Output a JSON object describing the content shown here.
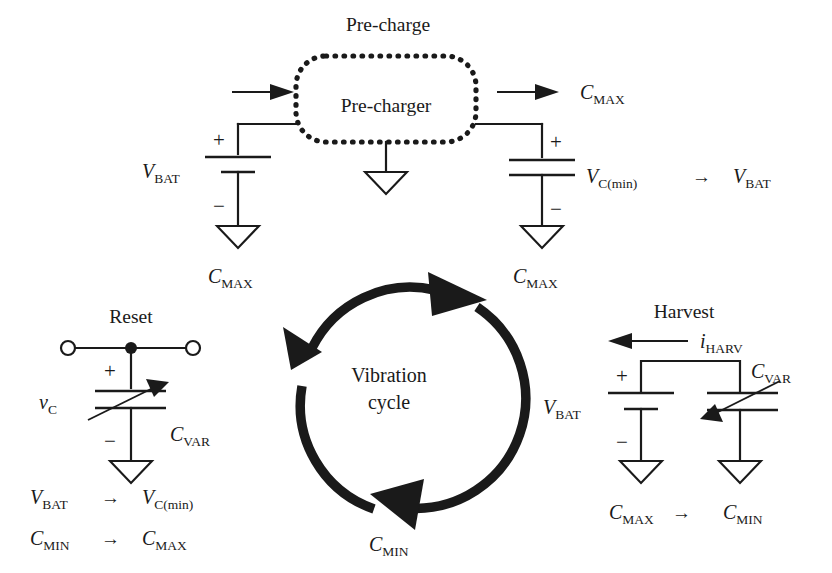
{
  "figure": {
    "background_color": "#ffffff",
    "ink_color": "#1a1a1a"
  },
  "precharge": {
    "stage_label": "Pre-charge",
    "block_label": "Pre-charger",
    "input_arrow": "arrow-right",
    "output_arrow": "arrow-right",
    "source": {
      "symbol": "battery",
      "label_v": "V",
      "label_sub": "BAT",
      "plus": "+",
      "minus": "−",
      "ground": "ground-symbol",
      "state_label_c": "C",
      "state_label_sub": "MAX"
    },
    "destination": {
      "symbol": "capacitor",
      "label_v": "V",
      "label_sub": "C(min)",
      "plus": "+",
      "minus": "−",
      "ground": "ground-symbol",
      "state_label_c": "C",
      "state_label_sub": "MAX"
    },
    "top_right_state": {
      "c": "C",
      "sub": "MAX"
    },
    "transition": {
      "from_v": "V",
      "from_sub": "C(min)",
      "arrow": "→",
      "to_v": "V",
      "to_sub": "BAT"
    }
  },
  "reset": {
    "stage_label": "Reset",
    "terminal_left": "open-terminal",
    "terminal_right": "open-terminal",
    "junction": "junction-dot",
    "plus": "+",
    "minus": "−",
    "voltage_label_v": "v",
    "voltage_label_sub": "C",
    "cap_label_c": "C",
    "cap_label_sub": "VAR",
    "ground": "ground-symbol",
    "transitions": [
      {
        "from_main": "V",
        "from_sub": "BAT",
        "arrow": "→",
        "to_main": "V",
        "to_sub": "C(min)"
      },
      {
        "from_main": "C",
        "from_sub": "MIN",
        "arrow": "→",
        "to_main": "C",
        "to_sub": "MAX"
      }
    ]
  },
  "harvest": {
    "stage_label": "Harvest",
    "current_label_i": "i",
    "current_label_sub": "HARV",
    "current_arrow": "arrow-left",
    "battery": {
      "label_v": "V",
      "label_sub": "BAT",
      "plus": "+",
      "minus": "−",
      "ground": "ground-symbol",
      "state_label_c": "C",
      "state_label_sub": "MAX"
    },
    "varcap": {
      "label_c": "C",
      "label_sub": "VAR",
      "ground": "ground-symbol",
      "state_label_c": "C",
      "state_label_sub": "MIN"
    },
    "transition_arrow": "→"
  },
  "cycle": {
    "label_line1": "Vibration",
    "label_line2": "cycle",
    "direction": "clockwise",
    "arrowheads": [
      "top-right",
      "bottom-left",
      "left"
    ],
    "state_top_right": {
      "c": "C",
      "sub": "MAX"
    },
    "state_bottom": {
      "c": "C",
      "sub": "MIN"
    }
  }
}
